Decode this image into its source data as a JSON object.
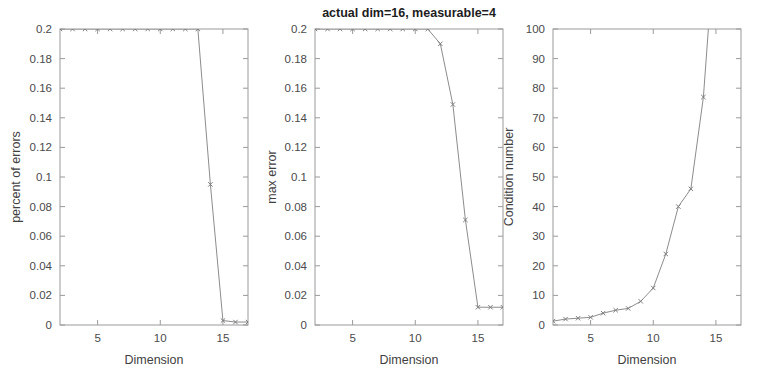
{
  "figure": {
    "title": "actual dim=16,  measurable=4",
    "background_color": "#ffffff",
    "axis_color": "#9a9a9a",
    "line_color": "#8c8c8c"
  },
  "chart_data": [
    {
      "type": "line",
      "title": "",
      "xlabel": "Dimension",
      "ylabel": "percent of errors",
      "xlim": [
        2,
        17
      ],
      "ylim": [
        0,
        0.2
      ],
      "xticks": [
        5,
        10,
        15
      ],
      "xticklabels": [
        "5",
        "10",
        "15"
      ],
      "yticks": [
        0,
        0.02,
        0.04,
        0.06,
        0.08,
        0.1,
        0.12,
        0.14,
        0.16,
        0.18,
        0.2
      ],
      "yticklabels": [
        "0",
        "0.02",
        "0.04",
        "0.06",
        "0.08",
        "0.1",
        "0.12",
        "0.14",
        "0.16",
        "0.18",
        "0.2"
      ],
      "grid": false,
      "legend": "none",
      "marker": "x",
      "x": [
        2,
        3,
        4,
        5,
        6,
        7,
        8,
        9,
        10,
        11,
        12,
        13,
        14,
        15,
        16,
        17
      ],
      "values": [
        0.2,
        0.2,
        0.2,
        0.2,
        0.2,
        0.2,
        0.2,
        0.2,
        0.2,
        0.2,
        0.2,
        0.2,
        0.095,
        0.003,
        0.002,
        0.002
      ]
    },
    {
      "type": "line",
      "title": "actual dim=16,  measurable=4",
      "xlabel": "Dimension",
      "ylabel": "max error",
      "xlim": [
        2,
        17
      ],
      "ylim": [
        0,
        0.2
      ],
      "xticks": [
        5,
        10,
        15
      ],
      "xticklabels": [
        "5",
        "10",
        "15"
      ],
      "yticks": [
        0,
        0.02,
        0.04,
        0.06,
        0.08,
        0.1,
        0.12,
        0.14,
        0.16,
        0.18,
        0.2
      ],
      "yticklabels": [
        "0",
        "0.02",
        "0.04",
        "0.06",
        "0.08",
        "0.1",
        "0.12",
        "0.14",
        "0.16",
        "0.18",
        "0.2"
      ],
      "grid": false,
      "legend": "none",
      "marker": "x",
      "x": [
        2,
        3,
        4,
        5,
        6,
        7,
        8,
        9,
        10,
        11,
        12,
        13,
        14,
        15,
        16,
        17
      ],
      "values": [
        0.2,
        0.2,
        0.2,
        0.2,
        0.2,
        0.2,
        0.2,
        0.2,
        0.2,
        0.2,
        0.19,
        0.149,
        0.071,
        0.012,
        0.012,
        0.012
      ]
    },
    {
      "type": "line",
      "title": "",
      "xlabel": "Dimension",
      "ylabel": "Condition number",
      "xlim": [
        2,
        17
      ],
      "ylim": [
        0,
        100
      ],
      "xticks": [
        5,
        10,
        15
      ],
      "xticklabels": [
        "5",
        "10",
        "15"
      ],
      "yticks": [
        0,
        10,
        20,
        30,
        40,
        50,
        60,
        70,
        80,
        90,
        100
      ],
      "yticklabels": [
        "0",
        "10",
        "20",
        "30",
        "40",
        "50",
        "60",
        "70",
        "80",
        "90",
        "100"
      ],
      "grid": false,
      "legend": "none",
      "marker": "x",
      "x": [
        2,
        3,
        4,
        5,
        6,
        7,
        8,
        9,
        10,
        11,
        12,
        13,
        14,
        15
      ],
      "values": [
        1.3,
        2.0,
        2.3,
        2.6,
        4.0,
        5.0,
        5.6,
        8.0,
        12.5,
        24.0,
        40.0,
        46.0,
        77.0,
        135.0
      ]
    }
  ]
}
